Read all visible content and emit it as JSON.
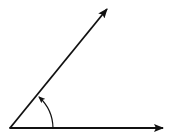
{
  "diagram": {
    "type": "angle",
    "background": "#ffffff",
    "stroke_color": "#111111",
    "vertex": {
      "x": 10,
      "y": 128
    },
    "rays": [
      {
        "name": "initial-side",
        "end": {
          "x": 163,
          "y": 128
        }
      },
      {
        "name": "terminal-side",
        "end": {
          "x": 107,
          "y": 9
        }
      }
    ],
    "arc": {
      "start": {
        "x": 53,
        "y": 128
      },
      "end": {
        "x": 39,
        "y": 97
      },
      "direction": "counterclockwise"
    }
  }
}
